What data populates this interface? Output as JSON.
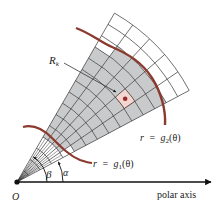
{
  "diagram": {
    "type": "polar-region-partition",
    "origin": {
      "x": 17,
      "y": 182
    },
    "alpha_deg": 28,
    "beta_deg": 60,
    "angular_divisions": 5,
    "ring_spacing": 13,
    "ring_count": 15,
    "highlight_cell": {
      "ring": 10,
      "wedge": 1
    },
    "colors": {
      "curve": "#8b3a2e",
      "shade": "#c9cacb",
      "highlight": "#f3d6d0",
      "grid": "#333333",
      "dot": "#9b2b2b"
    },
    "g1_polar": [
      [
        85,
        55
      ],
      [
        56,
        50.5
      ],
      [
        38,
        55
      ],
      [
        25,
        64
      ],
      [
        14,
        77
      ]
    ],
    "g2_polar": [
      [
        69,
        165
      ],
      [
        59,
        160
      ],
      [
        47,
        166
      ],
      [
        37.5,
        168
      ],
      [
        26,
        163
      ],
      [
        21,
        159
      ]
    ]
  },
  "labels": {
    "region": "R",
    "region_sub": "k",
    "g2_lhs": "r",
    "g2_eq": "=",
    "g2_fn": "g",
    "g2_sub": "2",
    "g2_arg": "(θ)",
    "g1_lhs": "r",
    "g1_eq": "=",
    "g1_fn": "g",
    "g1_sub": "1",
    "g1_arg": "(θ)",
    "beta": "β",
    "alpha": "α",
    "origin": "O",
    "axis": "polar axis"
  }
}
